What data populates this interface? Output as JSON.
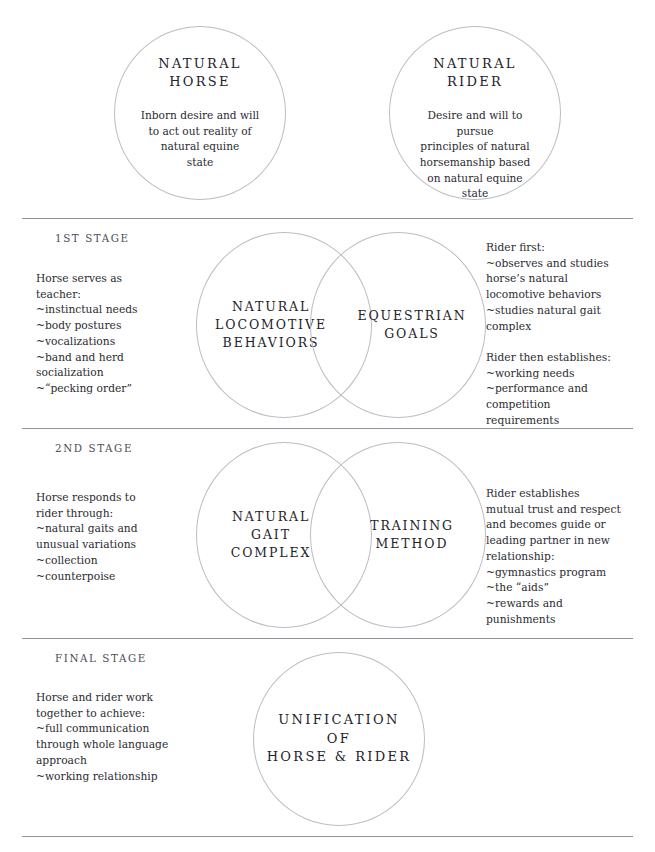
{
  "top": {
    "horse": {
      "title": "Natural\nHorse",
      "body": "Inborn desire and will\nto act out reality of\nnatural equine\nstate"
    },
    "rider": {
      "title": "Natural\nRider",
      "body": "Desire and will to pursue\nprinciples of natural\nhorsemanship based\non natural equine\nstate"
    }
  },
  "stages": [
    {
      "label": "1st Stage",
      "left_text": "Horse serves as\nteacher:\n~instinctual needs\n~body postures\n~vocalizations\n~band and herd\n  socialization\n~“pecking order”",
      "venn_left": "Natural\nLocomotive\nBehaviors",
      "venn_right": "Equestrian\nGoals",
      "right_text": "Rider first:\n~observes and studies\n  horse’s natural\n  locomotive behaviors\n~studies natural gait\n  complex\n\nRider then establishes:\n~working needs\n~performance and\n  competition\n  requirements"
    },
    {
      "label": "2nd Stage",
      "left_text": "Horse responds to\nrider through:\n~natural gaits and\n unusual variations\n~collection\n~counterpoise",
      "venn_left": "Natural\nGait\nComplex",
      "venn_right": "Training\nMethod",
      "right_text": "Rider establishes\nmutual trust and respect\nand becomes guide or\nleading partner in new\nrelationship:\n~gymnastics program\n~the “aids”\n~rewards and\n  punishments"
    },
    {
      "label": "Final Stage",
      "left_text": "Horse and rider work\ntogether to achieve:\n~full communication\n through whole language\n approach\n~working relationship",
      "center_circle": "Unification\nof\nHorse & Rider"
    }
  ],
  "colors": {
    "circle_stroke": "#bcbcc4",
    "divider": "#6c6c78",
    "text": "#2b2b33",
    "label": "#4e4e58"
  }
}
